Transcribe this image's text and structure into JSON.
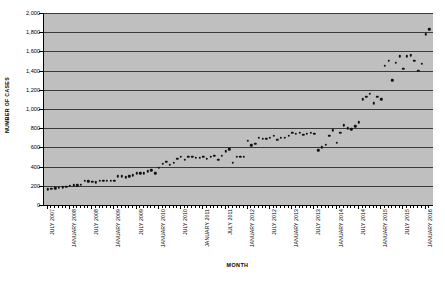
{
  "chart_data": {
    "type": "scatter",
    "title": "",
    "xlabel": "MONTH",
    "ylabel": "NUMBER OF CASES",
    "ylim": [
      0,
      2000
    ],
    "ytick_step": 200,
    "ytick_labels": [
      "0",
      "200",
      "400",
      "600",
      "800",
      "1,000",
      "1,200",
      "1,400",
      "1,600",
      "1,800",
      "2,000"
    ],
    "grid": true,
    "legend": "none",
    "x_axis_type": "monthly",
    "x_start": "JULY 2007",
    "x_end": "JANUARY 2016",
    "xtick_labels": [
      "JULY 2007",
      "JANUARY 2008",
      "JULY 2008",
      "JANUARY 2009",
      "JULY 2009",
      "JANUARY 2010",
      "JULY 2010",
      "JANUARY 2011",
      "JULY 2011",
      "JANUARY 2012",
      "JULY 2012",
      "JANUARY 2013",
      "JULY 2013",
      "JANUARY 2014",
      "JULY 2014",
      "JANUARY 2015",
      "JULY 2015",
      "JANUARY 2016"
    ],
    "x": [
      "2007-07",
      "2007-08",
      "2007-09",
      "2007-10",
      "2007-11",
      "2007-12",
      "2008-01",
      "2008-02",
      "2008-03",
      "2008-04",
      "2008-05",
      "2008-06",
      "2008-07",
      "2008-08",
      "2008-09",
      "2008-10",
      "2008-11",
      "2008-12",
      "2009-01",
      "2009-02",
      "2009-03",
      "2009-04",
      "2009-05",
      "2009-06",
      "2009-07",
      "2009-08",
      "2009-09",
      "2009-10",
      "2009-11",
      "2009-12",
      "2010-01",
      "2010-02",
      "2010-03",
      "2010-04",
      "2010-05",
      "2010-06",
      "2010-07",
      "2010-08",
      "2010-09",
      "2010-10",
      "2010-11",
      "2010-12",
      "2011-01",
      "2011-02",
      "2011-03",
      "2011-04",
      "2011-05",
      "2011-06",
      "2011-07",
      "2011-08",
      "2011-09",
      "2011-10",
      "2011-11",
      "2011-12",
      "2012-01",
      "2012-02",
      "2012-03",
      "2012-04",
      "2012-05",
      "2012-06",
      "2012-07",
      "2012-08",
      "2012-09",
      "2012-10",
      "2012-11",
      "2012-12",
      "2013-01",
      "2013-02",
      "2013-03",
      "2013-04",
      "2013-05",
      "2013-06",
      "2013-07",
      "2013-08",
      "2013-09",
      "2013-10",
      "2013-11",
      "2013-12",
      "2014-01",
      "2014-02",
      "2014-03",
      "2014-04",
      "2014-05",
      "2014-06",
      "2014-07",
      "2014-08",
      "2014-09",
      "2014-10",
      "2014-11",
      "2014-12",
      "2015-01",
      "2015-02",
      "2015-03",
      "2015-04",
      "2015-05",
      "2015-06",
      "2015-07",
      "2015-08",
      "2015-09",
      "2015-10",
      "2015-11",
      "2015-12",
      "2016-01",
      "2016-02"
    ],
    "values": [
      165,
      170,
      172,
      180,
      185,
      190,
      200,
      205,
      205,
      210,
      250,
      245,
      240,
      235,
      255,
      250,
      250,
      250,
      255,
      300,
      300,
      290,
      300,
      310,
      330,
      330,
      330,
      350,
      360,
      330,
      390,
      430,
      450,
      420,
      440,
      480,
      500,
      470,
      500,
      500,
      490,
      490,
      500,
      480,
      500,
      510,
      470,
      510,
      560,
      580,
      440,
      500,
      500,
      500,
      670,
      620,
      640,
      700,
      690,
      690,
      700,
      720,
      680,
      700,
      700,
      720,
      750,
      740,
      750,
      730,
      740,
      750,
      740,
      570,
      600,
      630,
      720,
      780,
      650,
      750,
      830,
      800,
      790,
      820,
      860,
      1100,
      1130,
      1160,
      1060,
      1130,
      1100,
      1450,
      1500,
      1300,
      1480,
      1550,
      1420,
      1550,
      1560,
      1500,
      1400,
      1470,
      1780,
      1830
    ]
  }
}
